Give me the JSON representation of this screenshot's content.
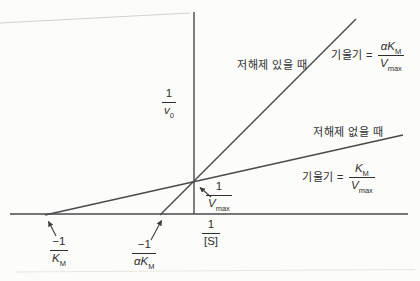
{
  "colors": {
    "background": "#fcfcfa",
    "line": "#4a4a4a",
    "text": "#2f2f2f",
    "scan_artifact": "#d2d2cc"
  },
  "y_axis_label": {
    "num": "1",
    "den_base": "v",
    "den_sub": "0"
  },
  "x_axis_label": {
    "num": "1",
    "den": "[S]"
  },
  "line_labels": {
    "with_inhibitor": "저해제 있을 때",
    "without_inhibitor": "저해제 없을 때"
  },
  "slope_with": {
    "prefix": "기울기 =",
    "num_alpha": "α",
    "num_base": "K",
    "num_sub": "M",
    "den_base": "V",
    "den_sub": "max"
  },
  "slope_without": {
    "prefix": "기울기 =",
    "num_base": "K",
    "num_sub": "M",
    "den_base": "V",
    "den_sub": "max"
  },
  "y_intercept_label": {
    "num": "1",
    "den_base": "V",
    "den_sub": "max"
  },
  "x_intercept_km": {
    "num": "−1",
    "den_base": "K",
    "den_sub": "M"
  },
  "x_intercept_akm": {
    "num": "−1",
    "den_alpha": "α",
    "den_base": "K",
    "den_sub": "M"
  },
  "chart_data": {
    "type": "line",
    "xlabel": "1/[S]",
    "ylabel": "1/v0",
    "grid": false,
    "x_axis_px": {
      "x1": 10,
      "x2": 408,
      "y": 214
    },
    "y_axis_px": {
      "x": 194,
      "y1": 12,
      "y2": 214
    },
    "intersection_px": [
      194,
      181
    ],
    "alpha_ratio": 4.5,
    "series": [
      {
        "name": "저해제 없을 때 (no inhibitor)",
        "slope": "KM/Vmax",
        "x_intercept": "−1/KM",
        "y_intercept": "1/Vmax",
        "points_px": [
          [
            45,
            215
          ],
          [
            403,
            135
          ]
        ]
      },
      {
        "name": "저해제 있을 때 (with inhibitor)",
        "slope": "αKM/Vmax",
        "x_intercept": "−1/αKM",
        "y_intercept": "1/Vmax",
        "points_px": [
          [
            160,
            215
          ],
          [
            356,
            19
          ]
        ]
      }
    ]
  }
}
